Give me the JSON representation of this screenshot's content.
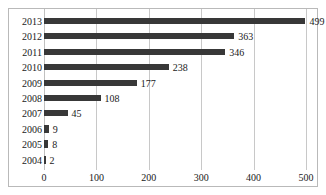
{
  "chart_data": {
    "type": "bar",
    "orientation": "horizontal",
    "title": "",
    "subtitle": "",
    "xlabel": "",
    "ylabel": "",
    "categories": [
      "2013",
      "2012",
      "2011",
      "2010",
      "2009",
      "2008",
      "2007",
      "2006",
      "2005",
      "2004"
    ],
    "values": [
      499,
      363,
      346,
      238,
      177,
      108,
      45,
      9,
      8,
      2
    ],
    "data_labels": [
      "499",
      "363",
      "346",
      "238",
      "177",
      "108",
      "45",
      "9",
      "8",
      "2"
    ],
    "xlim": [
      0,
      500
    ],
    "xticks": [
      0,
      100,
      200,
      300,
      400,
      500
    ],
    "xtick_labels": [
      "0",
      "100",
      "200",
      "300",
      "400",
      "500"
    ],
    "grid": "vertical",
    "legend": "none",
    "bar_color": "#383838",
    "gridline_color": "#c8c8c8",
    "border_color": "#b9b9b9",
    "text_color": "#1a1a1a",
    "background_color": "#ffffff"
  }
}
